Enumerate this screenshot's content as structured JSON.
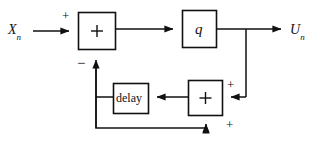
{
  "diagram": {
    "type": "block-diagram",
    "background_color": "#ffffff",
    "line_color": "#111111",
    "signals": {
      "input_label": "X",
      "input_subscript": "n",
      "output_label": "U",
      "output_subscript": "n"
    },
    "blocks": {
      "summer1": {
        "label": "+",
        "name": "summing-junction-1"
      },
      "quantizer": {
        "label": "q",
        "name": "quantizer-block"
      },
      "delay": {
        "label": "delay",
        "name": "delay-block"
      },
      "summer2": {
        "label": "+",
        "name": "summing-junction-2"
      }
    },
    "signs": {
      "input_plus": "+",
      "feedback_minus": "−",
      "summer2_right_plus": "+",
      "summer2_bottom_plus": "+"
    }
  }
}
